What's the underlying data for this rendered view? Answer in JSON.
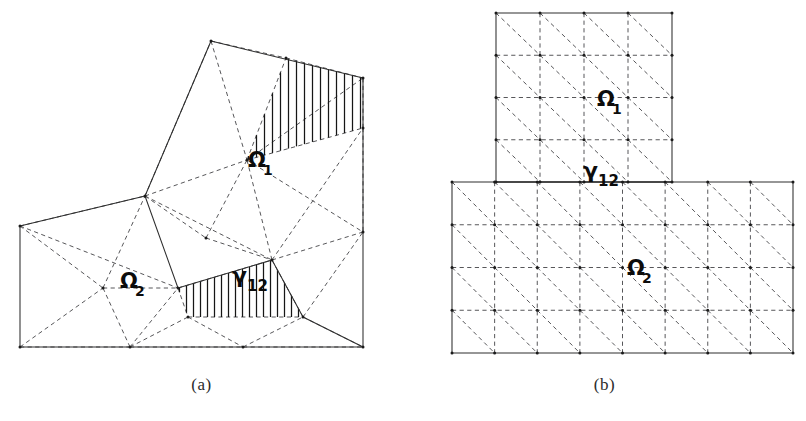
{
  "figure": {
    "type": "diagram",
    "background_color": "#ffffff",
    "ink_color": "#2e2e2e",
    "dash_color": "#57575a",
    "hatch_color": "#161616"
  },
  "panels": [
    {
      "id": "a",
      "caption": "(a)",
      "kind": "unstructured-triangular-mesh",
      "outer_boundary_style": "solid",
      "interior_edge_style": "dashed",
      "labels": [
        {
          "name": "omega-1",
          "base": "Ω",
          "sub": "1",
          "x": 248,
          "y": 167
        },
        {
          "name": "omega-2",
          "base": "Ω",
          "sub": "2",
          "x": 120,
          "y": 288
        },
        {
          "name": "gamma-12",
          "base": "γ",
          "sub": "12",
          "x": 232,
          "y": 283
        }
      ],
      "outer_polygon": [
        [
          20,
          226
        ],
        [
          145,
          196
        ],
        [
          211,
          41
        ],
        [
          363,
          78
        ],
        [
          363,
          347
        ],
        [
          20,
          347
        ]
      ],
      "interface_polyline": [
        [
          145,
          196
        ],
        [
          178,
          288
        ],
        [
          272,
          260
        ],
        [
          303,
          317
        ],
        [
          363,
          347
        ]
      ],
      "hatched_regions": [
        {
          "name": "hatch-upper",
          "polygon": [
            [
              286,
              58
            ],
            [
              363,
              78
            ],
            [
              363,
              128
            ],
            [
              247,
              160
            ]
          ],
          "direction": "vertical",
          "spacing": 8
        },
        {
          "name": "hatch-lower",
          "polygon": [
            [
              178,
              288
            ],
            [
              272,
              260
            ],
            [
              303,
              317
            ],
            [
              188,
              317
            ]
          ],
          "direction": "vertical",
          "spacing": 7
        }
      ],
      "dashed_edges": [
        [
          [
            211,
            41
          ],
          [
            247,
            160
          ]
        ],
        [
          [
            211,
            41
          ],
          [
            286,
            58
          ]
        ],
        [
          [
            145,
            196
          ],
          [
            247,
            160
          ]
        ],
        [
          [
            145,
            196
          ],
          [
            211,
            41
          ]
        ],
        [
          [
            247,
            160
          ],
          [
            286,
            58
          ]
        ],
        [
          [
            247,
            160
          ],
          [
            363,
            128
          ]
        ],
        [
          [
            286,
            58
          ],
          [
            363,
            78
          ]
        ],
        [
          [
            363,
            128
          ],
          [
            363,
            78
          ]
        ],
        [
          [
            247,
            160
          ],
          [
            363,
            78
          ]
        ],
        [
          [
            20,
            226
          ],
          [
            145,
            196
          ]
        ],
        [
          [
            20,
            226
          ],
          [
            103,
            288
          ]
        ],
        [
          [
            20,
            226
          ],
          [
            178,
            288
          ]
        ],
        [
          [
            103,
            288
          ],
          [
            145,
            196
          ]
        ],
        [
          [
            103,
            288
          ],
          [
            178,
            288
          ]
        ],
        [
          [
            20,
            347
          ],
          [
            103,
            288
          ]
        ],
        [
          [
            20,
            347
          ],
          [
            130,
            347
          ]
        ],
        [
          [
            103,
            288
          ],
          [
            130,
            347
          ]
        ],
        [
          [
            130,
            347
          ],
          [
            178,
            288
          ]
        ],
        [
          [
            130,
            347
          ],
          [
            188,
            317
          ]
        ],
        [
          [
            178,
            288
          ],
          [
            188,
            317
          ]
        ],
        [
          [
            145,
            196
          ],
          [
            272,
            260
          ]
        ],
        [
          [
            145,
            196
          ],
          [
            206,
            238
          ]
        ],
        [
          [
            206,
            238
          ],
          [
            247,
            160
          ]
        ],
        [
          [
            206,
            238
          ],
          [
            272,
            260
          ]
        ],
        [
          [
            178,
            288
          ],
          [
            272,
            260
          ]
        ],
        [
          [
            247,
            160
          ],
          [
            272,
            260
          ]
        ],
        [
          [
            272,
            260
          ],
          [
            363,
            128
          ]
        ],
        [
          [
            272,
            260
          ],
          [
            363,
            232
          ]
        ],
        [
          [
            363,
            128
          ],
          [
            363,
            232
          ]
        ],
        [
          [
            247,
            160
          ],
          [
            363,
            232
          ]
        ],
        [
          [
            272,
            260
          ],
          [
            303,
            317
          ]
        ],
        [
          [
            188,
            317
          ],
          [
            303,
            317
          ]
        ],
        [
          [
            130,
            347
          ],
          [
            243,
            347
          ]
        ],
        [
          [
            188,
            317
          ],
          [
            243,
            347
          ]
        ],
        [
          [
            243,
            347
          ],
          [
            303,
            317
          ]
        ],
        [
          [
            243,
            347
          ],
          [
            363,
            347
          ]
        ],
        [
          [
            303,
            317
          ],
          [
            363,
            232
          ]
        ],
        [
          [
            303,
            317
          ],
          [
            363,
            347
          ]
        ]
      ],
      "nodes": [
        [
          20,
          226
        ],
        [
          145,
          196
        ],
        [
          211,
          41
        ],
        [
          286,
          58
        ],
        [
          363,
          78
        ],
        [
          363,
          128
        ],
        [
          247,
          160
        ],
        [
          206,
          238
        ],
        [
          272,
          260
        ],
        [
          363,
          232
        ],
        [
          363,
          347
        ],
        [
          303,
          317
        ],
        [
          188,
          317
        ],
        [
          243,
          347
        ],
        [
          130,
          347
        ],
        [
          20,
          347
        ],
        [
          103,
          288
        ],
        [
          178,
          288
        ]
      ]
    },
    {
      "id": "b",
      "caption": "(b)",
      "kind": "structured-triangular-mesh",
      "outer_boundary_style": "solid",
      "interior_edge_style": "dashed",
      "diagonal_direction": "top-left-to-bottom-right",
      "labels": [
        {
          "name": "omega-1",
          "base": "Ω",
          "sub": "1",
          "x": 597,
          "y": 106
        },
        {
          "name": "omega-2",
          "base": "Ω",
          "sub": "2",
          "x": 627,
          "y": 275
        },
        {
          "name": "gamma-12",
          "base": "γ",
          "sub": "12",
          "x": 583,
          "y": 178
        }
      ],
      "top_block": {
        "name": "omega-1-block",
        "x0": 496,
        "y0": 13,
        "x1": 672,
        "y1": 182,
        "cols": 4,
        "rows": 4
      },
      "bottom_block": {
        "name": "omega-2-block",
        "x0": 452,
        "y0": 182,
        "x1": 793,
        "y1": 353,
        "cols": 8,
        "rows": 4
      },
      "interface_segment": {
        "x0": 496,
        "y0": 182,
        "x1": 672,
        "y1": 182
      }
    }
  ],
  "chart_data": {
    "type": "diagram",
    "title": "",
    "subpanels": [
      "(a)",
      "(b)"
    ],
    "legend": [
      {
        "symbol": "solid-line",
        "meaning": "subdomain boundary / interface"
      },
      {
        "symbol": "dashed-line",
        "meaning": "finite element mesh edge"
      },
      {
        "symbol": "vertical-hatching",
        "meaning": "overlap region"
      }
    ],
    "subdomains": [
      "Ω₁",
      "Ω₂"
    ],
    "interface": "γ₁₂"
  }
}
